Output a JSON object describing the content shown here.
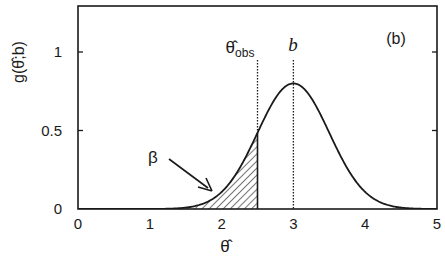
{
  "chart_data": {
    "type": "area",
    "title": "",
    "panel_label": "(b)",
    "xlabel": "θ̂",
    "ylabel": "g(θ̂;b)",
    "xlim": [
      0,
      5
    ],
    "ylim": [
      0,
      1.3
    ],
    "xticks": [
      0,
      1,
      2,
      3,
      4,
      5
    ],
    "xtick_labels": [
      "0",
      "1",
      "2",
      "3",
      "4",
      "5"
    ],
    "yticks": [
      0,
      0.5,
      1
    ],
    "ytick_labels": [
      "0",
      "0.5",
      "1"
    ],
    "grid": false,
    "legend": null,
    "series": [
      {
        "name": "g(θ̂;b)",
        "distribution": "gaussian",
        "mean": 3.0,
        "sigma": 0.5,
        "peak": 0.8,
        "x": [
          0,
          0.5,
          1,
          1.5,
          1.75,
          2,
          2.25,
          2.5,
          2.75,
          3,
          3.25,
          3.5,
          3.75,
          4,
          4.25,
          4.5,
          5
        ],
        "values": [
          0.0,
          0.0,
          0.0,
          0.009,
          0.035,
          0.108,
          0.259,
          0.484,
          0.704,
          0.798,
          0.704,
          0.484,
          0.259,
          0.108,
          0.035,
          0.009,
          0.0
        ]
      }
    ],
    "shaded_region": {
      "label": "β",
      "from": 0,
      "to": 2.5,
      "pattern": "diagonal-hatch"
    },
    "vertical_lines": [
      {
        "x": 2.5,
        "label": "θ̂obs",
        "style": "dotted"
      },
      {
        "x": 3.0,
        "label": "b",
        "style": "dotted"
      }
    ],
    "annotations": [
      {
        "text": "β",
        "arrow_to": [
          1.9,
          0.1
        ]
      }
    ]
  },
  "labels": {
    "panel": "(b)",
    "ylabel_main": "g(θ̂;b)",
    "xlabel": "θ̂",
    "theta_obs_main": "θ̂",
    "theta_obs_sub": "obs",
    "b": "b",
    "beta": "β",
    "xticks": [
      "0",
      "1",
      "2",
      "3",
      "4",
      "5"
    ],
    "yticks": [
      "0",
      "0.5",
      "1"
    ]
  }
}
